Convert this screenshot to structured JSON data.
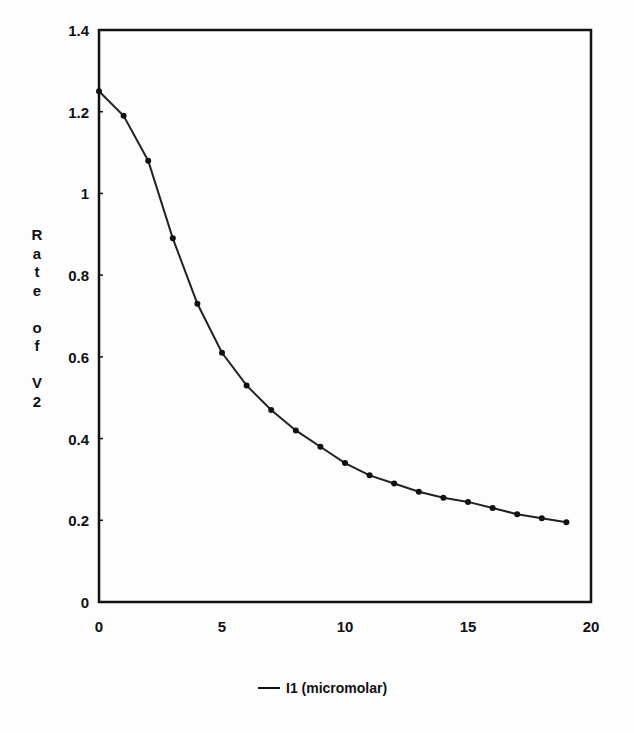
{
  "chart_data": {
    "type": "line",
    "title": "",
    "xlabel": "",
    "ylabel": "Rate of V2",
    "xlim": [
      0,
      20
    ],
    "ylim": [
      0,
      1.4
    ],
    "xticks": [
      "0",
      "5",
      "10",
      "15",
      "20"
    ],
    "yticks": [
      "0",
      "0.2",
      "0.4",
      "0.6",
      "0.8",
      "1",
      "1.2",
      "1.4"
    ],
    "grid": false,
    "legend_position": "bottom",
    "series": [
      {
        "name": "I1 (micromolar)",
        "x": [
          0,
          1,
          2,
          3,
          4,
          5,
          6,
          7,
          8,
          9,
          10,
          11,
          12,
          13,
          14,
          15,
          16,
          17,
          18,
          19
        ],
        "values": [
          1.25,
          1.19,
          1.08,
          0.89,
          0.73,
          0.61,
          0.53,
          0.47,
          0.42,
          0.38,
          0.34,
          0.31,
          0.29,
          0.27,
          0.255,
          0.245,
          0.23,
          0.215,
          0.205,
          0.195
        ]
      }
    ]
  },
  "ylabel_letters": [
    "R",
    "a",
    "t",
    "e",
    "",
    "o",
    "f",
    "",
    "V",
    "2"
  ],
  "legend_label": "I1 (micromolar)"
}
